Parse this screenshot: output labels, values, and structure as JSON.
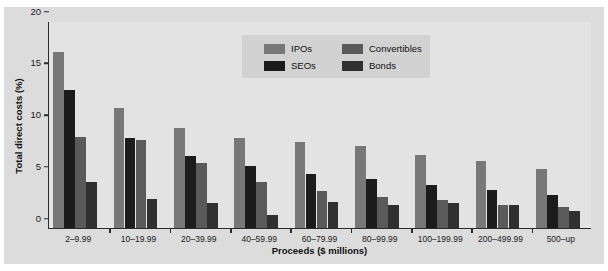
{
  "chart_data": {
    "type": "bar",
    "title": "",
    "xlabel": "Proceeds ($ millions)",
    "ylabel": "Total direct costs (%)",
    "ylim": [
      0,
      20
    ],
    "yticks": [
      0,
      5,
      10,
      15,
      20
    ],
    "grid": false,
    "legend_position": "top-center",
    "categories": [
      "2–9.99",
      "10–19.99",
      "20–39.99",
      "40–59.99",
      "60–79.99",
      "80–99.99",
      "100–199.99",
      "200–499.99",
      "500–up"
    ],
    "series": [
      {
        "name": "IPOs",
        "color": "#787878",
        "values": [
          17.0,
          11.6,
          9.7,
          8.7,
          8.3,
          7.9,
          7.1,
          6.5,
          5.7
        ]
      },
      {
        "name": "SEOs",
        "color": "#1c1c1c",
        "values": [
          13.3,
          8.7,
          7.0,
          6.0,
          5.2,
          4.7,
          4.2,
          3.7,
          3.2
        ]
      },
      {
        "name": "Convertibles",
        "color": "#5a5a5a",
        "values": [
          8.8,
          8.5,
          6.3,
          4.4,
          3.6,
          3.0,
          2.7,
          2.2,
          2.0
        ]
      },
      {
        "name": "Bonds",
        "color": "#303030",
        "values": [
          4.4,
          2.8,
          2.4,
          1.3,
          2.5,
          2.2,
          2.4,
          2.2,
          1.6
        ]
      }
    ]
  },
  "legend": {
    "entries": [
      {
        "label": "IPOs",
        "color": "#787878"
      },
      {
        "label": "SEOs",
        "color": "#1c1c1c"
      },
      {
        "label": "Convertibles",
        "color": "#5a5a5a"
      },
      {
        "label": "Bonds",
        "color": "#303030"
      }
    ]
  },
  "colors": {
    "page_background": "#ffffff",
    "panel_background": "#dcdcdc",
    "plot_background": "#e3e3e3",
    "axis": "#2b2b2b",
    "text": "#111111",
    "legend_background": "#d2d2d2"
  }
}
